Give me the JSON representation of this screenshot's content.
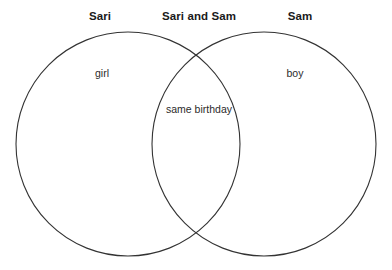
{
  "page": {
    "width": 392,
    "height": 270,
    "background_color": "#ffffff"
  },
  "diagram": {
    "type": "venn-two-set",
    "stroke_color": "#333333",
    "stroke_width": 1.1,
    "fill": "none",
    "left_circle": {
      "cx": 128,
      "cy": 144,
      "r": 112
    },
    "right_circle": {
      "cx": 264,
      "cy": 144,
      "r": 112
    }
  },
  "headers": {
    "left": "Sari",
    "center": "Sari and Sam",
    "right": "Sam"
  },
  "regions": {
    "left_only": "girl",
    "intersection": "same birthday",
    "right_only": "boy"
  },
  "chart_data": {
    "type": "venn",
    "title": "",
    "sets": [
      {
        "name": "Sari",
        "label": "Sari",
        "items": [
          "girl"
        ]
      },
      {
        "name": "Sam",
        "label": "Sam",
        "items": [
          "boy"
        ]
      }
    ],
    "intersection": {
      "label": "Sari and Sam",
      "items": [
        "same birthday"
      ]
    },
    "legend": "none",
    "grid": false
  }
}
